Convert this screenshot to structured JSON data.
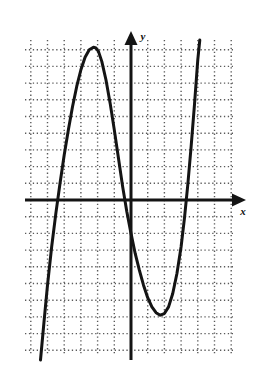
{
  "figure": {
    "title": "",
    "background_color": "#ffffff",
    "ink_color": "#141414",
    "grid_color": "#5a5a5a",
    "axis_label_x": "x",
    "axis_label_y": "y"
  },
  "chart_data": {
    "type": "line",
    "title": "",
    "subtitle": "",
    "xlabel": "x",
    "ylabel": "y",
    "grid": true,
    "grid_style": "dotted",
    "grid_spacing_units": 1,
    "legend": null,
    "legend_position": "none",
    "axes": {
      "x_axis_arrow": true,
      "y_axis_arrow": true,
      "x_axis_arrow_direction": "right",
      "y_axis_arrow_direction": "up",
      "tick_labels_x": [],
      "tick_labels_y": [],
      "origin_units": [
        0,
        0
      ],
      "xlim": [
        -6.5,
        6.2
      ],
      "ylim": [
        -9.5,
        9.6
      ]
    },
    "curve": {
      "name": "cubic polynomial",
      "shape": "cubic",
      "leading_coefficient_sign": "positive",
      "end_behavior_left": "down",
      "end_behavior_right": "up",
      "x_intercepts": [
        -2.1,
        0.5,
        2.8
      ],
      "local_maximum": [
        -1.2,
        9.1
      ],
      "local_minimum": [
        1.6,
        -6.8
      ],
      "y_intercept": -1.5,
      "points": [
        [
          -5.42,
          -9.58
        ],
        [
          -5.2,
          -7.2
        ],
        [
          -5.0,
          -5.1
        ],
        [
          -4.75,
          -2.8
        ],
        [
          -4.5,
          -0.8
        ],
        [
          -4.25,
          1.0
        ],
        [
          -4.0,
          2.7
        ],
        [
          -3.75,
          4.2
        ],
        [
          -3.5,
          5.6
        ],
        [
          -3.25,
          6.8
        ],
        [
          -3.0,
          7.8
        ],
        [
          -2.75,
          8.55
        ],
        [
          -2.5,
          9.0
        ],
        [
          -2.25,
          9.15
        ],
        [
          -2.1,
          9.1
        ],
        [
          -1.95,
          8.9
        ],
        [
          -1.75,
          8.3
        ],
        [
          -1.5,
          7.2
        ],
        [
          -1.25,
          5.8
        ],
        [
          -1.0,
          4.2
        ],
        [
          -0.75,
          2.5
        ],
        [
          -0.5,
          0.8
        ],
        [
          -0.25,
          -0.7
        ],
        [
          0.0,
          -2.0
        ],
        [
          0.25,
          -3.2
        ],
        [
          0.5,
          -4.2
        ],
        [
          0.75,
          -5.1
        ],
        [
          1.0,
          -5.85
        ],
        [
          1.25,
          -6.4
        ],
        [
          1.5,
          -6.75
        ],
        [
          1.75,
          -6.9
        ],
        [
          2.0,
          -6.8
        ],
        [
          2.25,
          -6.4
        ],
        [
          2.5,
          -5.6
        ],
        [
          2.75,
          -4.4
        ],
        [
          3.0,
          -2.8
        ],
        [
          3.2,
          -1.1
        ],
        [
          3.4,
          0.9
        ],
        [
          3.6,
          3.2
        ],
        [
          3.8,
          5.7
        ],
        [
          4.0,
          8.4
        ],
        [
          4.12,
          9.58
        ]
      ]
    }
  }
}
